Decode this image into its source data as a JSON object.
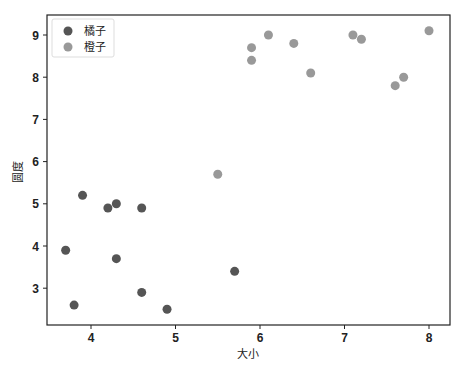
{
  "chart_data": {
    "type": "scatter",
    "title": "",
    "xlabel": "大小",
    "ylabel": "圆度",
    "xlim": [
      3.5,
      8.25
    ],
    "ylim": [
      2.25,
      9.35
    ],
    "xticks": [
      4,
      5,
      6,
      7,
      8
    ],
    "yticks": [
      3,
      4,
      5,
      6,
      7,
      8,
      9
    ],
    "grid": false,
    "legend_position": "upper left",
    "series": [
      {
        "name": "橘子",
        "color": "#555555",
        "points": [
          [
            3.7,
            3.9
          ],
          [
            3.8,
            2.6
          ],
          [
            3.9,
            5.2
          ],
          [
            4.2,
            4.9
          ],
          [
            4.3,
            5.0
          ],
          [
            4.3,
            3.7
          ],
          [
            4.6,
            4.9
          ],
          [
            4.6,
            2.9
          ],
          [
            4.9,
            2.5
          ],
          [
            5.7,
            3.4
          ]
        ]
      },
      {
        "name": "橙子",
        "color": "#999999",
        "points": [
          [
            5.5,
            5.7
          ],
          [
            5.9,
            8.7
          ],
          [
            5.9,
            8.4
          ],
          [
            6.1,
            9.0
          ],
          [
            6.4,
            8.8
          ],
          [
            6.6,
            8.1
          ],
          [
            7.1,
            9.0
          ],
          [
            7.2,
            8.9
          ],
          [
            7.6,
            7.8
          ],
          [
            7.7,
            8.0
          ],
          [
            8.0,
            9.1
          ]
        ]
      }
    ]
  }
}
